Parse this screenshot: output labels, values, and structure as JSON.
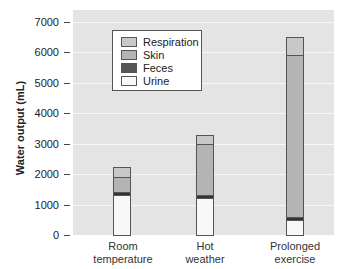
{
  "chart_data": {
    "type": "bar",
    "stacked": true,
    "title": "",
    "xlabel": "",
    "ylabel": "Water output (mL)",
    "ylim": [
      0,
      7000
    ],
    "yticks": [
      "0",
      "1000",
      "2000",
      "3000",
      "4000",
      "5000",
      "6000",
      "7000"
    ],
    "grid": true,
    "legend_position": "upper-left inside",
    "categories": [
      "Room temperature",
      "Hot weather",
      "Prolonged exercise"
    ],
    "category_lines": [
      [
        "Room",
        "temperature"
      ],
      [
        "Hot",
        "weather"
      ],
      [
        "Prolonged",
        "exercise"
      ]
    ],
    "series": [
      {
        "name": "Urine",
        "color": "#f8f8f8",
        "values": [
          1300,
          1200,
          500
        ]
      },
      {
        "name": "Feces",
        "color": "#333333",
        "values": [
          100,
          100,
          100
        ]
      },
      {
        "name": "Skin",
        "color": "#b4b4b4",
        "values": [
          500,
          1700,
          5300
        ]
      },
      {
        "name": "Respiration",
        "color": "#c8c8c8",
        "values": [
          350,
          300,
          600
        ]
      }
    ],
    "totals": [
      2250,
      3300,
      6500
    ]
  },
  "legend": [
    {
      "label": "Respiration",
      "color": "#c8c8c8"
    },
    {
      "label": "Skin",
      "color": "#b4b4b4"
    },
    {
      "label": "Feces",
      "color": "#555555"
    },
    {
      "label": "Urine",
      "color": "#f8f8f8"
    }
  ]
}
